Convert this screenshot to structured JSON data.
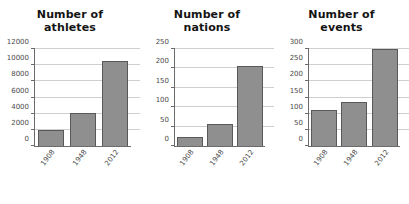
{
  "figure": {
    "background_color": "#ffffff",
    "bar_fill_color": "#8f8f8f",
    "bar_edge_color": "#595959",
    "grid_color": "#cfcfcf",
    "axis_color": "#6b6b6b"
  },
  "chart_data": [
    {
      "type": "bar",
      "title": "Number of athletes",
      "title_lines": [
        "Number of",
        "athletes"
      ],
      "categories": [
        "1908",
        "1948",
        "2012"
      ],
      "values": [
        2000,
        4100,
        10500
      ],
      "xlabel": "",
      "ylabel": "",
      "ylim": [
        0,
        12000
      ],
      "yticks": [
        0,
        2000,
        4000,
        6000,
        8000,
        10000,
        12000
      ],
      "ytick_labels": [
        "0",
        "2000",
        "4000",
        "6000",
        "8000",
        "10000",
        "12000"
      ],
      "grid": true,
      "legend": false
    },
    {
      "type": "bar",
      "title": "Number of nations",
      "title_lines": [
        "Number of",
        "nations"
      ],
      "categories": [
        "1908",
        "1948",
        "2012"
      ],
      "values": [
        22,
        57,
        205
      ],
      "xlabel": "",
      "ylabel": "",
      "ylim": [
        0,
        250
      ],
      "yticks": [
        0,
        50,
        100,
        150,
        200,
        250
      ],
      "ytick_labels": [
        "0",
        "50",
        "100",
        "150",
        "200",
        "250"
      ],
      "grid": true,
      "legend": false
    },
    {
      "type": "bar",
      "title": "Number of events",
      "title_lines": [
        "Number of",
        "events"
      ],
      "categories": [
        "1908",
        "1948",
        "2012"
      ],
      "values": [
        110,
        136,
        300
      ],
      "xlabel": "",
      "ylabel": "",
      "ylim": [
        0,
        300
      ],
      "yticks": [
        0,
        50,
        100,
        150,
        200,
        250,
        300
      ],
      "ytick_labels": [
        "0",
        "50",
        "100",
        "150",
        "200",
        "250",
        "300"
      ],
      "grid": true,
      "legend": false
    }
  ]
}
